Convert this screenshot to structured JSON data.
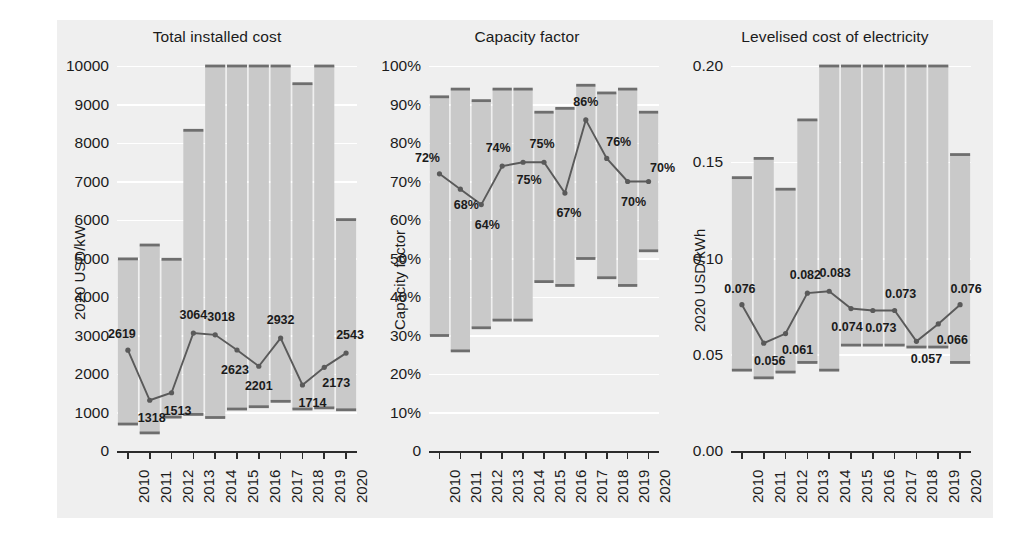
{
  "figure": {
    "background": "#efefef",
    "band_color": "#c9c9c9",
    "line_color": "#5a5a5a",
    "axis_color": "#2b2b2b",
    "gridline_color": "#ffffff"
  },
  "chart_data": [
    {
      "type": "line",
      "title": "Total installed cost",
      "xlabel": "",
      "ylabel": "2020 USD/kW",
      "categories": [
        "2010",
        "2011",
        "2012",
        "2013",
        "2014",
        "2015",
        "2016",
        "2017",
        "2018",
        "2019",
        "2020"
      ],
      "ylim": [
        0,
        10000
      ],
      "yticks": [
        0,
        1000,
        2000,
        3000,
        4000,
        5000,
        6000,
        7000,
        8000,
        9000,
        10000
      ],
      "ytick_labels": [
        "0",
        "1000",
        "2000",
        "3000",
        "4000",
        "5000",
        "6000",
        "7000",
        "8000",
        "9000",
        "10000"
      ],
      "grid": true,
      "legend": "none",
      "values": [
        2619,
        1318,
        1513,
        3064,
        3018,
        2623,
        2201,
        2932,
        1714,
        2173,
        2543
      ],
      "value_labels": [
        "2619",
        "1318",
        "1513",
        "3064",
        "3018",
        "2623",
        "2201",
        "2932",
        "1714",
        "2173",
        "2543"
      ],
      "band_low": [
        700,
        470,
        880,
        950,
        870,
        1090,
        1150,
        1290,
        1090,
        1120,
        1070
      ],
      "band_high": [
        4990,
        5350,
        4980,
        8330,
        10000,
        10000,
        10000,
        10000,
        9540,
        10000,
        6010
      ],
      "band_name": "5th–95th percentile range"
    },
    {
      "type": "line",
      "title": "Capacity factor",
      "xlabel": "",
      "ylabel": "Capacity factor",
      "categories": [
        "2010",
        "2011",
        "2012",
        "2013",
        "2014",
        "2015",
        "2016",
        "2017",
        "2018",
        "2019",
        "2020"
      ],
      "ylim": [
        0,
        100
      ],
      "yticks": [
        0,
        10,
        20,
        30,
        40,
        50,
        60,
        70,
        80,
        90,
        100
      ],
      "ytick_labels": [
        "0",
        "10%",
        "20%",
        "30%",
        "40%",
        "50%",
        "60%",
        "70%",
        "80%",
        "90%",
        "100%"
      ],
      "grid": true,
      "legend": "none",
      "values": [
        72,
        68,
        64,
        74,
        75,
        75,
        67,
        86,
        76,
        70,
        70
      ],
      "value_labels": [
        "72%",
        "68%",
        "64%",
        "74%",
        "75%",
        "75%",
        "67%",
        "86%",
        "76%",
        "70%",
        "70%"
      ],
      "band_low": [
        30,
        26,
        32,
        34,
        34,
        44,
        43,
        50,
        45,
        43,
        52
      ],
      "band_high": [
        92,
        94,
        91,
        94,
        94,
        88,
        89,
        95,
        93,
        94,
        88
      ],
      "band_name": "5th–95th percentile range"
    },
    {
      "type": "line",
      "title": "Levelised cost of electricity",
      "xlabel": "",
      "ylabel": "2020 USD/kWh",
      "categories": [
        "2010",
        "2011",
        "2012",
        "2013",
        "2014",
        "2015",
        "2016",
        "2017",
        "2018",
        "2019",
        "2020"
      ],
      "ylim": [
        0,
        0.2
      ],
      "yticks": [
        0,
        0.05,
        0.1,
        0.15,
        0.2
      ],
      "ytick_labels": [
        "0.00",
        "0.05",
        "0.10",
        "0.15",
        "0.20"
      ],
      "grid": true,
      "legend": "none",
      "values": [
        0.076,
        0.056,
        0.061,
        0.082,
        0.083,
        0.074,
        0.073,
        0.073,
        0.057,
        0.066,
        0.076
      ],
      "value_labels": [
        "0.076",
        "0.056",
        "0.061",
        "0.082",
        "0.083",
        "0.074",
        "0.073",
        "0.073",
        "0.057",
        "0.066",
        "0.076"
      ],
      "band_low": [
        0.042,
        0.038,
        0.041,
        0.046,
        0.042,
        0.055,
        0.055,
        0.055,
        0.054,
        0.054,
        0.046
      ],
      "band_high": [
        0.142,
        0.152,
        0.136,
        0.172,
        0.2,
        0.2,
        0.2,
        0.2,
        0.2,
        0.2,
        0.154
      ],
      "band_name": "5th–95th percentile range"
    }
  ],
  "label_offsets": [
    [
      [
        -6,
        -16
      ],
      [
        2,
        18
      ],
      [
        6,
        18
      ],
      [
        0,
        -18
      ],
      [
        6,
        -18
      ],
      [
        -2,
        20
      ],
      [
        0,
        20
      ],
      [
        0,
        -18
      ],
      [
        10,
        18
      ],
      [
        12,
        16
      ],
      [
        4,
        -18
      ]
    ],
    [
      [
        -12,
        -16
      ],
      [
        6,
        16
      ],
      [
        6,
        20
      ],
      [
        -4,
        -18
      ],
      [
        6,
        18
      ],
      [
        -2,
        -18
      ],
      [
        4,
        20
      ],
      [
        0,
        -18
      ],
      [
        12,
        -16
      ],
      [
        6,
        20
      ],
      [
        14,
        -14
      ]
    ],
    [
      [
        -2,
        -16
      ],
      [
        6,
        18
      ],
      [
        12,
        16
      ],
      [
        -2,
        -18
      ],
      [
        6,
        -18
      ],
      [
        -4,
        18
      ],
      [
        8,
        18
      ],
      [
        6,
        -16
      ],
      [
        10,
        18
      ],
      [
        14,
        16
      ],
      [
        6,
        -16
      ]
    ]
  ]
}
